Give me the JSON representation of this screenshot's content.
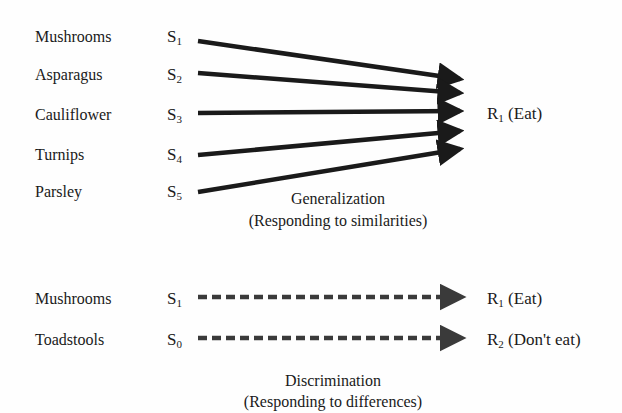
{
  "generalization": {
    "stimuli": [
      {
        "item": "Mushrooms",
        "symbol": "S",
        "subscript": "1"
      },
      {
        "item": "Asparagus",
        "symbol": "S",
        "subscript": "2"
      },
      {
        "item": "Cauliflower",
        "symbol": "S",
        "subscript": "3"
      },
      {
        "item": "Turnips",
        "symbol": "S",
        "subscript": "4"
      },
      {
        "item": "Parsley",
        "symbol": "S",
        "subscript": "5"
      }
    ],
    "response": {
      "symbol": "R",
      "subscript": "1",
      "label": "(Eat)"
    },
    "caption": {
      "title": "Generalization",
      "subtitle": "(Responding to similarities)"
    },
    "arrow_style": "solid"
  },
  "discrimination": {
    "pairs": [
      {
        "item": "Mushrooms",
        "stimulus": {
          "symbol": "S",
          "subscript": "1"
        },
        "response": {
          "symbol": "R",
          "subscript": "1",
          "label": "(Eat)"
        }
      },
      {
        "item": "Toadstools",
        "stimulus": {
          "symbol": "S",
          "subscript": "0"
        },
        "response": {
          "symbol": "R",
          "subscript": "2",
          "label": "(Don't eat)"
        }
      }
    ],
    "caption": {
      "title": "Discrimination",
      "subtitle": "(Responding to differences)"
    },
    "arrow_style": "dashed"
  },
  "colors": {
    "ink": "#1a1a1a",
    "dashed_ink": "#3a3a3a",
    "background": "#fefefe"
  }
}
